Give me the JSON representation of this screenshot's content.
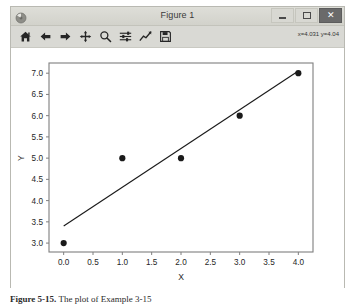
{
  "window": {
    "title": "Figure 1",
    "icon": "matplotlib-icon",
    "controls": {
      "minimize_label": "–",
      "maximize_label": "□",
      "close_label": "✕"
    }
  },
  "toolbar": {
    "items": [
      {
        "name": "home-icon",
        "label": "Home"
      },
      {
        "name": "back-arrow-icon",
        "label": "Back"
      },
      {
        "name": "forward-arrow-icon",
        "label": "Forward"
      },
      {
        "name": "pan-move-icon",
        "label": "Pan"
      },
      {
        "name": "zoom-magnifier-icon",
        "label": "Zoom to rectangle"
      },
      {
        "name": "configure-subplots-icon",
        "label": "Configure subplots"
      },
      {
        "name": "edit-curves-icon",
        "label": "Edit axis, curve and image parameters"
      },
      {
        "name": "save-floppy-icon",
        "label": "Save the figure"
      }
    ],
    "coordinates": "x=4.031 y=4.04"
  },
  "caption": {
    "prefix": "Figure 5-15.",
    "text": " The plot of Example 3-15"
  },
  "chart_data": {
    "type": "scatter",
    "title": "",
    "xlabel": "X",
    "ylabel": "Y",
    "xlim": [
      -0.25,
      4.25
    ],
    "ylim": [
      2.79,
      7.24
    ],
    "xticks": [
      "0.0",
      "0.5",
      "1.0",
      "1.5",
      "2.0",
      "2.5",
      "3.0",
      "3.5",
      "4.0"
    ],
    "xtick_values": [
      0.0,
      0.5,
      1.0,
      1.5,
      2.0,
      2.5,
      3.0,
      3.5,
      4.0
    ],
    "yticks": [
      "3.0",
      "3.5",
      "4.0",
      "4.5",
      "5.0",
      "5.5",
      "6.0",
      "6.5",
      "7.0"
    ],
    "ytick_values": [
      3.0,
      3.5,
      4.0,
      4.5,
      5.0,
      5.5,
      6.0,
      6.5,
      7.0
    ],
    "grid": false,
    "legend": null,
    "series": [
      {
        "name": "data points",
        "type": "scatter",
        "marker": "o",
        "color": "#1a1a1a",
        "x": [
          0,
          1,
          2,
          3,
          4
        ],
        "y": [
          3,
          5,
          5,
          6,
          7
        ]
      },
      {
        "name": "regression line",
        "type": "line",
        "color": "#1a1a1a",
        "x": [
          0,
          4
        ],
        "y": [
          3.4,
          7.05
        ]
      }
    ]
  },
  "colors": {
    "window_frame": "#d9d9d4",
    "titlebar": "#d2d2cb",
    "canvas": "#ffffff",
    "ink": "#1a1a1a",
    "close_button": "#6a6a6a"
  }
}
